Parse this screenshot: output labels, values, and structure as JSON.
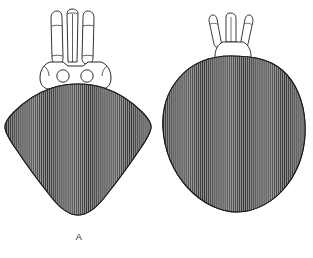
{
  "plate": {
    "background": "#ffffff",
    "ink": "#1a1a1a",
    "scutum_fill": "#8e8e8e",
    "hatch_color": "#3a3a3a",
    "ornament_color": "#ffffff",
    "groove_color": "#000000",
    "width": 313,
    "height": 258
  },
  "figures": [
    {
      "id": "A",
      "label": "A",
      "name": "tick-dorsal-view-male-figure-a",
      "description": "Dorsal view of a hard tick with elongated capitulum, two porose areas, shield-shaped scutum with vertical hatching, dark curved cervical grooves, lateral pale eye spots and a large pale punctate posterior patch",
      "parts": [
        {
          "name": "capitulum",
          "label": "capitulum"
        },
        {
          "name": "palp-left",
          "label": "left palp"
        },
        {
          "name": "hypostome",
          "label": "hypostome"
        },
        {
          "name": "palp-right",
          "label": "right palp"
        },
        {
          "name": "basis-capituli",
          "label": "basis capituli"
        },
        {
          "name": "porose-area-left",
          "label": "left porose area"
        },
        {
          "name": "porose-area-right",
          "label": "right porose area"
        },
        {
          "name": "scutum",
          "label": "scutum"
        },
        {
          "name": "cervical-groove-left",
          "label": "left cervical groove"
        },
        {
          "name": "cervical-groove-right",
          "label": "right cervical groove"
        },
        {
          "name": "eye-spot-left",
          "label": "left eye"
        },
        {
          "name": "eye-spot-right",
          "label": "right eye"
        },
        {
          "name": "posterior-pale-patch",
          "label": "posterior pale patch"
        }
      ]
    },
    {
      "id": "B",
      "label": "B",
      "name": "tick-dorsal-view-female-figure-b",
      "description": "Dorsal view of an engorging tick with short capitulum, broad oval body with vertical hatching, short black cervical grooves, pale lateral ornamentation bands and a row of festoons along the posterior margin",
      "parts": [
        {
          "name": "capitulum",
          "label": "capitulum"
        },
        {
          "name": "palp-left",
          "label": "left palp"
        },
        {
          "name": "hypostome",
          "label": "hypostome"
        },
        {
          "name": "palp-right",
          "label": "right palp"
        },
        {
          "name": "basis-capituli",
          "label": "basis capituli"
        },
        {
          "name": "idiosoma",
          "label": "idiosoma"
        },
        {
          "name": "cervical-groove-left",
          "label": "left cervical groove"
        },
        {
          "name": "cervical-groove-right",
          "label": "right cervical groove"
        },
        {
          "name": "lateral-ornament-left",
          "label": "left lateral ornamentation"
        },
        {
          "name": "lateral-ornament-right",
          "label": "right lateral ornamentation"
        },
        {
          "name": "eye-spot-right",
          "label": "right eye"
        },
        {
          "name": "festoons",
          "label": "festoons"
        }
      ]
    }
  ]
}
